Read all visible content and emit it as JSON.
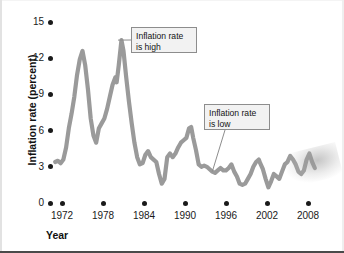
{
  "figure": {
    "background_color": "#ffffff",
    "line_color": "#9a9a9a",
    "tick_color": "#1a1a1a",
    "callout_fill": "#f2f2f2",
    "callout_border": "#8d8d8d"
  },
  "axes": {
    "ylabel": "Inflation rate (percent)",
    "xlabel": "Year",
    "yticks": [
      "0",
      "3",
      "6",
      "9",
      "12",
      "15"
    ],
    "xticks": [
      "1972",
      "1978",
      "1984",
      "1990",
      "1996",
      "2002",
      "2008"
    ]
  },
  "annotations": [
    {
      "name": "inflation-high",
      "text": "Inflation rate\nis high"
    },
    {
      "name": "inflation-low",
      "text": "Inflation rate\nis low"
    }
  ],
  "chart_data": {
    "type": "line",
    "title": "",
    "xlabel": "Year",
    "ylabel": "Inflation rate (percent)",
    "xlim": [
      1971.0,
      2009.5
    ],
    "ylim": [
      0,
      15
    ],
    "yticks": [
      0,
      3,
      6,
      9,
      12,
      15
    ],
    "xticks": [
      1972,
      1978,
      1984,
      1990,
      1996,
      2002,
      2008
    ],
    "grid": false,
    "legend": "none",
    "annotations": [
      {
        "text": "Inflation rate is high",
        "points_to_x": 1980.2,
        "points_to_y": 13.5
      },
      {
        "text": "Inflation rate is low",
        "points_to_x": 1994.0,
        "points_to_y": 2.6
      }
    ],
    "series": [
      {
        "name": "Inflation rate",
        "x": [
          1971.0,
          1971.4,
          1971.8,
          1972.2,
          1972.6,
          1973.0,
          1973.4,
          1973.8,
          1974.2,
          1974.6,
          1975.0,
          1975.4,
          1975.8,
          1976.2,
          1976.6,
          1977.0,
          1977.4,
          1977.8,
          1978.2,
          1978.6,
          1979.0,
          1979.4,
          1979.8,
          1980.0,
          1980.3,
          1980.7,
          1981.0,
          1981.4,
          1981.8,
          1982.2,
          1982.6,
          1983.0,
          1983.4,
          1983.8,
          1984.2,
          1984.6,
          1985.0,
          1985.4,
          1985.8,
          1986.2,
          1986.6,
          1987.0,
          1987.4,
          1987.8,
          1988.2,
          1988.6,
          1989.0,
          1989.4,
          1989.8,
          1990.2,
          1990.6,
          1990.9,
          1991.2,
          1991.6,
          1992.0,
          1992.4,
          1992.8,
          1993.2,
          1993.6,
          1994.0,
          1994.4,
          1994.8,
          1995.2,
          1995.6,
          1996.0,
          1996.4,
          1996.8,
          1997.2,
          1997.6,
          1998.0,
          1998.4,
          1998.8,
          1999.2,
          1999.6,
          2000.0,
          2000.4,
          2000.8,
          2001.0,
          2001.4,
          2001.8,
          2002.2,
          2002.6,
          2003.0,
          2003.4,
          2003.8,
          2004.2,
          2004.6,
          2005.0,
          2005.4,
          2005.8,
          2006.2,
          2006.6,
          2007.0,
          2007.4,
          2007.8,
          2008.2,
          2008.6,
          2009.0
        ],
        "y": [
          3.4,
          3.5,
          3.3,
          3.6,
          4.6,
          6.2,
          7.4,
          8.8,
          10.6,
          11.9,
          12.6,
          11.4,
          9.4,
          7.0,
          5.6,
          5.0,
          6.2,
          6.6,
          7.0,
          7.8,
          8.8,
          9.8,
          10.4,
          10.0,
          11.4,
          13.5,
          12.6,
          10.4,
          8.4,
          6.6,
          5.0,
          3.8,
          3.2,
          3.3,
          4.0,
          4.3,
          3.8,
          3.6,
          3.4,
          2.4,
          1.6,
          2.0,
          3.8,
          4.1,
          3.8,
          4.1,
          4.6,
          5.0,
          5.2,
          5.4,
          6.2,
          6.3,
          5.4,
          4.4,
          3.2,
          3.0,
          3.1,
          3.0,
          2.8,
          2.6,
          2.5,
          2.7,
          2.9,
          2.7,
          2.7,
          2.9,
          3.2,
          2.6,
          2.2,
          1.6,
          1.5,
          1.6,
          2.0,
          2.4,
          3.0,
          3.4,
          3.6,
          3.3,
          2.8,
          2.0,
          1.3,
          1.8,
          2.4,
          2.2,
          2.0,
          2.6,
          3.2,
          3.4,
          3.9,
          3.6,
          3.2,
          2.6,
          2.4,
          2.7,
          3.6,
          4.1,
          3.4,
          2.9
        ]
      }
    ]
  }
}
